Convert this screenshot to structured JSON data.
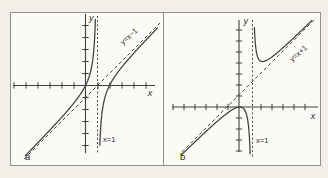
{
  "figure": {
    "panels": [
      {
        "id": "a",
        "panel_label": "a",
        "x_axis_label": "x",
        "y_axis_label": "y",
        "vertical_asymptote_label": "x=1",
        "oblique_asymptote_label": "y=x−1",
        "render": {
          "x_axis": [
            13,
            85.5,
            155,
            85.5
          ],
          "y_axis": [
            85.5,
            14,
            85.5,
            153
          ],
          "x_ticks": [
            14,
            26,
            38,
            50,
            62,
            74,
            98,
            110,
            122,
            134,
            146
          ],
          "y_ticks": [
            25.5,
            37.5,
            49.5,
            61.5,
            73.5,
            97.5,
            109.5,
            121.5,
            133.5,
            145.5
          ],
          "tick_half": 3.2,
          "vx": 97.5,
          "v_asym": [
            97.5,
            16,
            153
          ],
          "oblique": [
            24,
            159,
            160,
            23
          ],
          "branches": [
            {
              "from": 25,
              "to": 96.8,
              "C": 144,
              "top": 15,
              "bottom": 156.5
            },
            {
              "from": 98.6,
              "to": 158,
              "C": 144,
              "top": 15,
              "bottom": 155.5
            }
          ]
        }
      },
      {
        "id": "b",
        "panel_label": "b",
        "x_axis_label": "x",
        "y_axis_label": "y",
        "vertical_asymptote_label": "x=1",
        "oblique_asymptote_label": "y=x+1",
        "render": {
          "x_axis": [
            172,
            107,
            318,
            107
          ],
          "y_axis": [
            239,
            20,
            239,
            152
          ],
          "x_ticks": [
            173,
            184,
            195,
            206,
            217,
            228,
            261,
            272,
            283,
            294,
            305
          ],
          "y_ticks": [
            30,
            41,
            52,
            63,
            74,
            85,
            96,
            118,
            129,
            140,
            151
          ],
          "tick_half": 3.2,
          "vx": 252.5,
          "v_asym": [
            252.5,
            20,
            157
          ],
          "oblique": [
            182,
            152,
            316,
            18
          ],
          "branches": [
            {
              "from": 181,
              "to": 251.8,
              "C": -162,
              "top": 19,
              "bottom": 157.5
            },
            {
              "from": 253.2,
              "to": 312,
              "C": -100,
              "top": 19.5,
              "bottom": 157.5
            }
          ]
        }
      }
    ]
  },
  "chart_data": [
    {
      "type": "line",
      "panel": "a",
      "curve_function": "y = (x² − 2x)/(x − 1) = x − 1 − 1/(x − 1)",
      "asymptotes": {
        "vertical": "x = 1",
        "oblique": "y = x − 1"
      },
      "asymptote_labels_shown": [
        "y=x−1",
        "x=1"
      ],
      "x_intercepts": [
        0,
        2
      ],
      "branch_domains": [
        "x < 1",
        "x > 1"
      ],
      "branch_behavior": [
        "rises along y=x−1 from lower left, passes through origin, → +∞ as x→1⁻",
        "→ −∞ as x→1⁺, crosses x-axis at x=2, approaches y=x−1 from below"
      ],
      "xlabel": "x",
      "ylabel": "y",
      "tick_spacing": 1,
      "axis_numbers_shown": false,
      "xlim": [
        -6,
        6
      ],
      "ylim": [
        -6,
        6
      ],
      "line_styles": {
        "curve": "solid",
        "asymptotes": "dashed"
      }
    },
    {
      "type": "line",
      "panel": "b",
      "curve_function": "y = x²/(x − 1) = x + 1 + 1/(x − 1)",
      "asymptotes": {
        "vertical": "x = 1",
        "oblique": "y = x + 1"
      },
      "asymptote_labels_shown": [
        "y=x+1",
        "x=1"
      ],
      "x_intercepts": [
        0
      ],
      "local_max": [
        0,
        0
      ],
      "local_min": [
        2,
        4
      ],
      "branch_domains": [
        "x < 1",
        "x > 1"
      ],
      "branch_behavior": [
        "rises along y=x+1 from lower left, touches x-axis at origin (local max), → −∞ as x→1⁻",
        "→ +∞ as x→1⁺, local min near (2,4), approaches y=x+1 from above"
      ],
      "xlabel": "x",
      "ylabel": "y",
      "tick_spacing": 1,
      "axis_numbers_shown": false,
      "xlim": [
        -6,
        7
      ],
      "ylim": [
        -4,
        8
      ],
      "line_styles": {
        "curve": "solid",
        "asymptotes": "dashed"
      }
    }
  ],
  "colors": {
    "line": "#3f3f3f",
    "dashed": "#4a4a4a",
    "frame": "#8f8f8c",
    "text": "#2b2b2b",
    "page_bg": "#f2efe9",
    "panel_bg": "#fbfaf7"
  }
}
